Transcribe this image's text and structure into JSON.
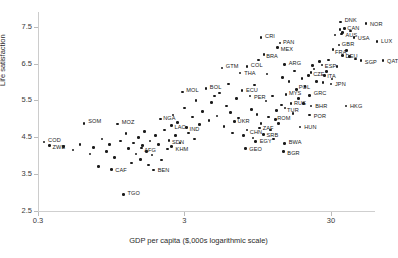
{
  "chart_data": {
    "type": "scatter",
    "title": "",
    "xlabel": "GDP per capita ($,000s logarithmic scale)",
    "ylabel": "Life satisfaction",
    "xscale": "log",
    "xlim": [
      0.3,
      60
    ],
    "ylim": [
      2.5,
      7.9
    ],
    "xticks": [
      "0.3",
      "3",
      "30"
    ],
    "xtick_values": [
      0.3,
      3,
      30
    ],
    "yticks": [
      "2.5",
      "3.5",
      "4.5",
      "5.5",
      "6.5",
      "7.5"
    ],
    "ytick_values": [
      2.5,
      3.5,
      4.5,
      5.5,
      6.5,
      7.5
    ],
    "grid": false,
    "legend": false,
    "marker": "dot",
    "marker_color": "#1a1a1a",
    "points": [
      {
        "label": "COD",
        "x": 0.33,
        "y": 4.37,
        "lx": 4,
        "ly": -2
      },
      {
        "label": "ZWE",
        "x": 0.36,
        "y": 4.28,
        "lx": 3,
        "ly": 2
      },
      {
        "label": "SOM",
        "x": 0.62,
        "y": 4.88,
        "lx": 4,
        "ly": -2
      },
      {
        "label": "MOZ",
        "x": 1.05,
        "y": 4.86,
        "lx": 4,
        "ly": -2
      },
      {
        "label": "CAF",
        "x": 0.95,
        "y": 3.62,
        "lx": 4,
        "ly": 0
      },
      {
        "label": "BEN",
        "x": 1.85,
        "y": 3.61,
        "lx": 4,
        "ly": 0
      },
      {
        "label": "TGO",
        "x": 1.15,
        "y": 2.95,
        "lx": 4,
        "ly": -1
      },
      {
        "label": "AFG",
        "x": 1.52,
        "y": 4.21,
        "lx": 3,
        "ly": 2
      },
      {
        "label": "SDN",
        "x": 2.35,
        "y": 4.42,
        "lx": 3,
        "ly": 2
      },
      {
        "label": "KHM",
        "x": 2.45,
        "y": 4.25,
        "lx": 4,
        "ly": 2
      },
      {
        "label": "NGA",
        "x": 2.05,
        "y": 5.0,
        "lx": 3,
        "ly": -1
      },
      {
        "label": "LAO",
        "x": 2.45,
        "y": 4.82,
        "lx": 3,
        "ly": 1
      },
      {
        "label": "IND",
        "x": 3.1,
        "y": 4.77,
        "lx": 3,
        "ly": 2
      },
      {
        "label": "MOL",
        "x": 2.9,
        "y": 5.73,
        "lx": 4,
        "ly": -2
      },
      {
        "label": "BOL",
        "x": 4.2,
        "y": 5.82,
        "lx": 4,
        "ly": -2
      },
      {
        "label": "GTM",
        "x": 5.4,
        "y": 6.38,
        "lx": 4,
        "ly": -2
      },
      {
        "label": "THA",
        "x": 7.2,
        "y": 6.25,
        "lx": 4,
        "ly": 0
      },
      {
        "label": "COL",
        "x": 8.0,
        "y": 6.42,
        "lx": 4,
        "ly": -2
      },
      {
        "label": "ECU",
        "x": 7.4,
        "y": 5.77,
        "lx": 4,
        "ly": 0
      },
      {
        "label": "PER",
        "x": 8.4,
        "y": 5.62,
        "lx": 4,
        "ly": 1
      },
      {
        "label": "UKR",
        "x": 6.6,
        "y": 4.93,
        "lx": 3,
        "ly": 0
      },
      {
        "label": "CHN",
        "x": 8.0,
        "y": 4.7,
        "lx": 3,
        "ly": 2
      },
      {
        "label": "ZAF",
        "x": 9.8,
        "y": 4.75,
        "lx": 3,
        "ly": 0
      },
      {
        "label": "ROM",
        "x": 12.5,
        "y": 4.98,
        "lx": 2,
        "ly": -2
      },
      {
        "label": "SRB",
        "x": 10.4,
        "y": 4.58,
        "lx": 3,
        "ly": 1
      },
      {
        "label": "EGY",
        "x": 9.2,
        "y": 4.38,
        "lx": 4,
        "ly": -1
      },
      {
        "label": "GEO",
        "x": 7.8,
        "y": 4.2,
        "lx": 4,
        "ly": 1
      },
      {
        "label": "BWA",
        "x": 14.5,
        "y": 4.33,
        "lx": 4,
        "ly": -2
      },
      {
        "label": "BGR",
        "x": 14.2,
        "y": 4.11,
        "lx": 4,
        "ly": 1
      },
      {
        "label": "HUN",
        "x": 18.5,
        "y": 4.78,
        "lx": 4,
        "ly": 0
      },
      {
        "label": "MYS",
        "x": 14.8,
        "y": 5.66,
        "lx": 3,
        "ly": -2
      },
      {
        "label": "POL",
        "x": 17.5,
        "y": 5.8,
        "lx": 2,
        "ly": -2
      },
      {
        "label": "RUS",
        "x": 16.0,
        "y": 5.42,
        "lx": 3,
        "ly": 0
      },
      {
        "label": "TUR",
        "x": 14.6,
        "y": 5.3,
        "lx": 2,
        "ly": 2
      },
      {
        "label": "GRC",
        "x": 21.5,
        "y": 5.64,
        "lx": 4,
        "ly": -2
      },
      {
        "label": "BHR",
        "x": 22.0,
        "y": 5.35,
        "lx": 4,
        "ly": 0
      },
      {
        "label": "POR",
        "x": 21.5,
        "y": 5.1,
        "lx": 4,
        "ly": 1
      },
      {
        "label": "HKG",
        "x": 38.0,
        "y": 5.35,
        "lx": 4,
        "ly": 0
      },
      {
        "label": "ARG",
        "x": 14.5,
        "y": 6.47,
        "lx": 4,
        "ly": -2
      },
      {
        "label": "BRA",
        "x": 10.5,
        "y": 6.75,
        "lx": 2,
        "ly": 2
      },
      {
        "label": "MEX",
        "x": 13.0,
        "y": 6.93,
        "lx": 3,
        "ly": 1
      },
      {
        "label": "PAN",
        "x": 13.5,
        "y": 7.06,
        "lx": 3,
        "ly": -1
      },
      {
        "label": "CRI",
        "x": 10.0,
        "y": 7.2,
        "lx": 4,
        "ly": -2
      },
      {
        "label": "CZE",
        "x": 22.0,
        "y": 6.26,
        "lx": 2,
        "ly": 2
      },
      {
        "label": "ITA",
        "x": 27.0,
        "y": 6.18,
        "lx": 3,
        "ly": 1
      },
      {
        "label": "JPN",
        "x": 30.0,
        "y": 5.95,
        "lx": 4,
        "ly": 0
      },
      {
        "label": "ESP",
        "x": 26.0,
        "y": 6.46,
        "lx": 3,
        "ly": 1
      },
      {
        "label": "DEU",
        "x": 36.0,
        "y": 6.72,
        "lx": 3,
        "ly": 1
      },
      {
        "label": "FRA",
        "x": 31.0,
        "y": 6.88,
        "lx": 2,
        "ly": 2
      },
      {
        "label": "GBR",
        "x": 34.0,
        "y": 7.0,
        "lx": 3,
        "ly": -1
      },
      {
        "label": "SGP",
        "x": 48.0,
        "y": 6.58,
        "lx": 4,
        "ly": 1
      },
      {
        "label": "QAT",
        "x": 68.0,
        "y": 6.58,
        "lx": 4,
        "ly": 0
      },
      {
        "label": "LUX",
        "x": 62.0,
        "y": 7.1,
        "lx": 4,
        "ly": 0
      },
      {
        "label": "USA",
        "x": 43.0,
        "y": 7.2,
        "lx": 4,
        "ly": 0
      },
      {
        "label": "AUS",
        "x": 36.0,
        "y": 7.34,
        "lx": 3,
        "ly": 2
      },
      {
        "label": "CAN",
        "x": 37.0,
        "y": 7.45,
        "lx": 3,
        "ly": -1
      },
      {
        "label": "NOR",
        "x": 52.0,
        "y": 7.58,
        "lx": 4,
        "ly": 0
      },
      {
        "label": "DNK",
        "x": 35.0,
        "y": 7.63,
        "lx": 4,
        "ly": -2
      }
    ],
    "unlabeled_points": [
      {
        "x": 0.45,
        "y": 4.25
      },
      {
        "x": 0.52,
        "y": 4.15
      },
      {
        "x": 0.58,
        "y": 4.3
      },
      {
        "x": 0.68,
        "y": 4.05
      },
      {
        "x": 0.72,
        "y": 4.22
      },
      {
        "x": 0.78,
        "y": 3.7
      },
      {
        "x": 0.82,
        "y": 4.45
      },
      {
        "x": 0.88,
        "y": 4.12
      },
      {
        "x": 0.92,
        "y": 4.3
      },
      {
        "x": 1.0,
        "y": 3.95
      },
      {
        "x": 1.1,
        "y": 4.4
      },
      {
        "x": 1.2,
        "y": 4.6
      },
      {
        "x": 1.25,
        "y": 4.2
      },
      {
        "x": 1.3,
        "y": 3.8
      },
      {
        "x": 1.35,
        "y": 4.35
      },
      {
        "x": 1.4,
        "y": 4.05
      },
      {
        "x": 1.45,
        "y": 4.5
      },
      {
        "x": 1.5,
        "y": 3.9
      },
      {
        "x": 1.55,
        "y": 4.28
      },
      {
        "x": 1.6,
        "y": 4.65
      },
      {
        "x": 1.65,
        "y": 4.12
      },
      {
        "x": 1.7,
        "y": 3.75
      },
      {
        "x": 1.75,
        "y": 4.4
      },
      {
        "x": 1.8,
        "y": 4.02
      },
      {
        "x": 1.9,
        "y": 4.55
      },
      {
        "x": 2.0,
        "y": 4.3
      },
      {
        "x": 2.1,
        "y": 3.88
      },
      {
        "x": 2.2,
        "y": 4.7
      },
      {
        "x": 2.3,
        "y": 4.18
      },
      {
        "x": 2.5,
        "y": 5.1
      },
      {
        "x": 2.6,
        "y": 4.55
      },
      {
        "x": 2.7,
        "y": 4.9
      },
      {
        "x": 2.8,
        "y": 4.35
      },
      {
        "x": 3.0,
        "y": 5.3
      },
      {
        "x": 3.2,
        "y": 4.62
      },
      {
        "x": 3.4,
        "y": 5.05
      },
      {
        "x": 3.5,
        "y": 4.45
      },
      {
        "x": 3.6,
        "y": 5.5
      },
      {
        "x": 3.8,
        "y": 4.85
      },
      {
        "x": 4.0,
        "y": 5.2
      },
      {
        "x": 4.4,
        "y": 4.95
      },
      {
        "x": 4.6,
        "y": 5.45
      },
      {
        "x": 4.8,
        "y": 5.62
      },
      {
        "x": 5.0,
        "y": 5.08
      },
      {
        "x": 5.2,
        "y": 5.7
      },
      {
        "x": 5.6,
        "y": 4.8
      },
      {
        "x": 5.8,
        "y": 5.35
      },
      {
        "x": 6.0,
        "y": 5.95
      },
      {
        "x": 6.2,
        "y": 5.18
      },
      {
        "x": 6.4,
        "y": 4.62
      },
      {
        "x": 6.8,
        "y": 5.55
      },
      {
        "x": 7.0,
        "y": 5.02
      },
      {
        "x": 7.6,
        "y": 4.55
      },
      {
        "x": 8.6,
        "y": 5.25
      },
      {
        "x": 9.0,
        "y": 5.92
      },
      {
        "x": 9.4,
        "y": 5.12
      },
      {
        "x": 10.0,
        "y": 4.88
      },
      {
        "x": 10.8,
        "y": 5.48
      },
      {
        "x": 11.2,
        "y": 5.05
      },
      {
        "x": 11.6,
        "y": 4.7
      },
      {
        "x": 12.0,
        "y": 5.62
      },
      {
        "x": 12.8,
        "y": 5.22
      },
      {
        "x": 13.2,
        "y": 4.88
      },
      {
        "x": 15.5,
        "y": 6.02
      },
      {
        "x": 16.5,
        "y": 5.15
      },
      {
        "x": 17.0,
        "y": 6.3
      },
      {
        "x": 18.0,
        "y": 5.55
      },
      {
        "x": 19.0,
        "y": 6.1
      },
      {
        "x": 20.0,
        "y": 5.88
      },
      {
        "x": 23.0,
        "y": 6.35
      },
      {
        "x": 24.0,
        "y": 6.02
      },
      {
        "x": 25.0,
        "y": 6.55
      },
      {
        "x": 26.5,
        "y": 5.98
      },
      {
        "x": 28.0,
        "y": 6.28
      },
      {
        "x": 29.0,
        "y": 6.6
      },
      {
        "x": 30.5,
        "y": 6.08
      },
      {
        "x": 32.0,
        "y": 7.28
      },
      {
        "x": 33.0,
        "y": 6.42
      },
      {
        "x": 34.5,
        "y": 7.42
      },
      {
        "x": 35.5,
        "y": 7.3
      },
      {
        "x": 38.5,
        "y": 6.85
      },
      {
        "x": 40.0,
        "y": 6.7
      },
      {
        "x": 41.0,
        "y": 7.38
      },
      {
        "x": 44.0,
        "y": 6.62
      },
      {
        "x": 22.5,
        "y": 6.45
      },
      {
        "x": 21.0,
        "y": 6.18
      },
      {
        "x": 19.5,
        "y": 5.42
      },
      {
        "x": 14.0,
        "y": 6.12
      },
      {
        "x": 13.8,
        "y": 5.38
      },
      {
        "x": 12.2,
        "y": 4.45
      },
      {
        "x": 11.0,
        "y": 6.22
      },
      {
        "x": 9.6,
        "y": 6.6
      },
      {
        "x": 8.8,
        "y": 4.48
      }
    ]
  }
}
